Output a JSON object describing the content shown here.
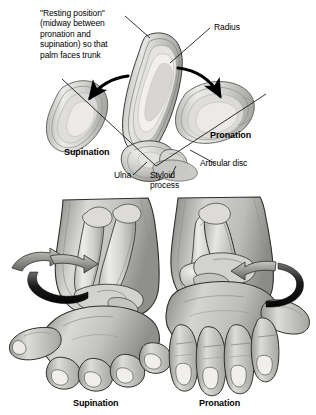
{
  "figure": {
    "title_note": "Pronation and supination of the forearm",
    "panels": [
      {
        "id": "top",
        "name": "distal-radioulnar-joint-cross-section",
        "callouts": {
          "resting_position": "\"Resting position\"\n(midway between\npronation and\nsupination) so that\npalm faces trunk",
          "radius": "Radius",
          "ulna": "Ulna",
          "styloid_process": "Styloid\nprocess",
          "articular_disc": "Articular disc",
          "supination": "Supination",
          "pronation": "Pronation"
        },
        "arrows": [
          {
            "name": "supination-arrow",
            "direction": "down-left"
          },
          {
            "name": "pronation-arrow",
            "direction": "down-right"
          }
        ]
      },
      {
        "id": "bottom",
        "name": "forearm-hand-rotation-views",
        "views": [
          {
            "name": "supination-hand",
            "label": "Supination",
            "bones": "parallel",
            "palm": "up",
            "rotation": "lateral"
          },
          {
            "name": "pronation-hand",
            "label": "Pronation",
            "bones": "crossed",
            "palm": "down",
            "rotation": "medial"
          }
        ]
      }
    ]
  },
  "colors": {
    "background": "#ffffff",
    "ink": "#000000",
    "bone_light": "#e8e8e6",
    "bone_mid": "#c9c9c6",
    "bone_dark": "#9a9a97",
    "skin_light": "#d8d8d5",
    "skin_mid": "#b4b4b1",
    "skin_dark": "#8c8c89",
    "outline": "#2b2b2b",
    "arrow_fill": "#111111"
  }
}
